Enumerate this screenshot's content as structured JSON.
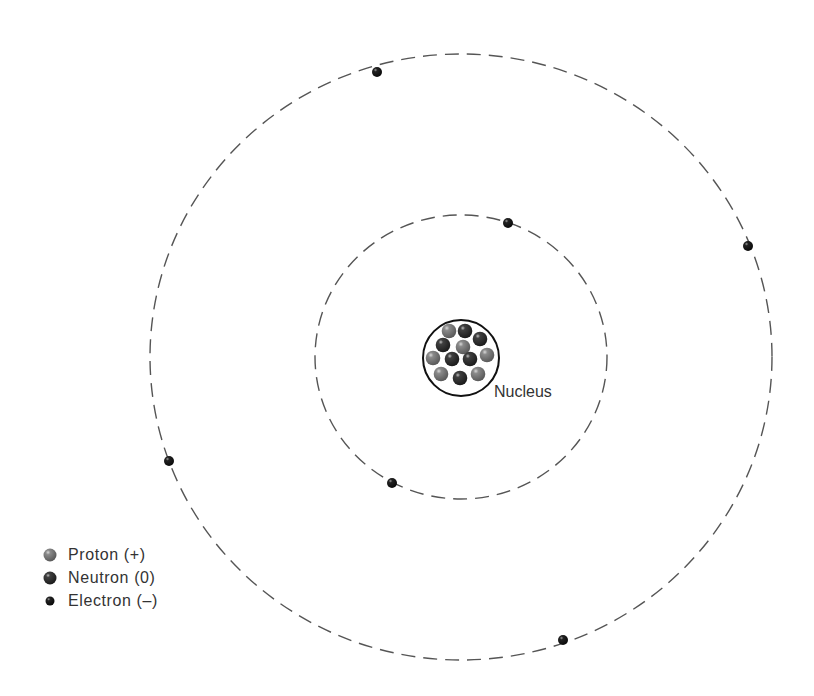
{
  "diagram": {
    "title": "",
    "nucleus_label": "Nucleus",
    "colors": {
      "proton": "#7a7a7a",
      "neutron": "#3a3a3a",
      "electron": "#1e1e1e",
      "orbit": "#555555"
    },
    "orbits": [
      {
        "name": "inner-orbit",
        "cx": 461,
        "cy": 357,
        "rx": 146,
        "ry": 142
      },
      {
        "name": "outer-orbit",
        "cx": 461,
        "cy": 357,
        "rx": 311,
        "ry": 303
      }
    ],
    "electrons": [
      {
        "orbit": "outer",
        "x": 377,
        "y": 72
      },
      {
        "orbit": "outer",
        "x": 748,
        "y": 246
      },
      {
        "orbit": "outer",
        "x": 169,
        "y": 461
      },
      {
        "orbit": "outer",
        "x": 563,
        "y": 640
      },
      {
        "orbit": "inner",
        "x": 508,
        "y": 223
      },
      {
        "orbit": "inner",
        "x": 392,
        "y": 483
      }
    ],
    "nucleus": {
      "cx": 461,
      "cy": 358,
      "r": 38,
      "particles": [
        {
          "type": "proton",
          "x": 449,
          "y": 331
        },
        {
          "type": "neutron",
          "x": 465,
          "y": 331
        },
        {
          "type": "neutron",
          "x": 443,
          "y": 345
        },
        {
          "type": "neutron",
          "x": 480,
          "y": 339
        },
        {
          "type": "proton",
          "x": 463,
          "y": 347
        },
        {
          "type": "proton",
          "x": 433,
          "y": 358
        },
        {
          "type": "neutron",
          "x": 452,
          "y": 359
        },
        {
          "type": "neutron",
          "x": 470,
          "y": 359
        },
        {
          "type": "proton",
          "x": 487,
          "y": 355
        },
        {
          "type": "proton",
          "x": 441,
          "y": 374
        },
        {
          "type": "neutron",
          "x": 460,
          "y": 378
        },
        {
          "type": "proton",
          "x": 478,
          "y": 374
        }
      ]
    }
  },
  "legend": {
    "items": [
      {
        "type": "proton",
        "label": "Proton (+)"
      },
      {
        "type": "neutron",
        "label": "Neutron (0)"
      },
      {
        "type": "electron",
        "label": "Electron (–)"
      }
    ]
  }
}
